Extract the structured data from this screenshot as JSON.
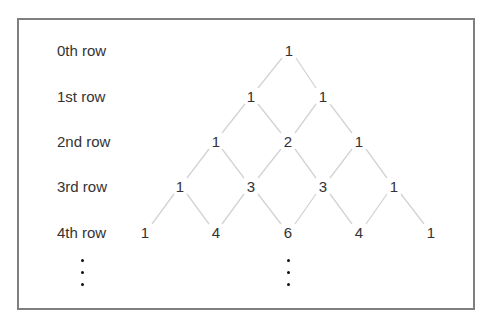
{
  "diagram": {
    "row_labels": [
      "0th row",
      "1st row",
      "2nd row",
      "3rd row",
      "4th row"
    ],
    "rows": [
      [
        1
      ],
      [
        1,
        1
      ],
      [
        1,
        2,
        1
      ],
      [
        1,
        3,
        3,
        1
      ],
      [
        1,
        4,
        6,
        4,
        1
      ]
    ],
    "continuation": "⋮",
    "colors": {
      "border": "#7f7f7f",
      "lines": "#d0d0d0",
      "text": "#333333"
    }
  }
}
